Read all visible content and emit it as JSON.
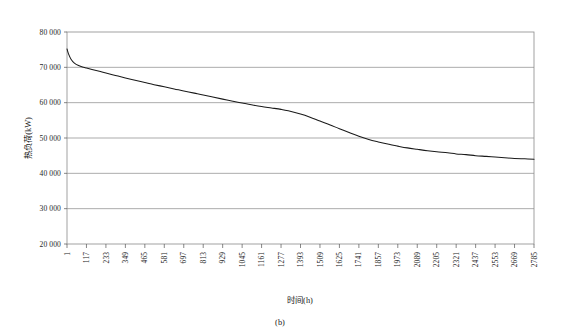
{
  "figure": {
    "caption": "(b)",
    "background": "#ffffff"
  },
  "chart_data": {
    "type": "line",
    "title": "",
    "xlabel": "时间(h)",
    "ylabel": "热负荷(kW)",
    "xlim": [
      1,
      2785
    ],
    "ylim": [
      20000,
      80000
    ],
    "grid": true,
    "legend": "none",
    "line_color": "#1a1a1a",
    "ytick_labels": [
      "80 000",
      "70 000",
      "60 000",
      "50 000",
      "40 000",
      "30 000",
      "20 000"
    ],
    "ytick_values": [
      80000,
      70000,
      60000,
      50000,
      40000,
      30000,
      20000
    ],
    "xtick_labels": [
      "1",
      "117",
      "233",
      "349",
      "465",
      "581",
      "697",
      "813",
      "929",
      "1045",
      "1161",
      "1277",
      "1393",
      "1509",
      "1625",
      "1741",
      "1857",
      "1973",
      "2089",
      "2205",
      "2321",
      "2437",
      "2553",
      "2669",
      "2785"
    ],
    "xtick_values": [
      1,
      117,
      233,
      349,
      465,
      581,
      697,
      813,
      929,
      1045,
      1161,
      1277,
      1393,
      1509,
      1625,
      1741,
      1857,
      1973,
      2089,
      2205,
      2321,
      2437,
      2553,
      2669,
      2785
    ],
    "series": [
      {
        "name": "热负荷",
        "x": [
          1,
          10,
          25,
          45,
          70,
          100,
          117,
          150,
          200,
          233,
          290,
          349,
          420,
          465,
          520,
          581,
          640,
          697,
          760,
          813,
          870,
          929,
          990,
          1045,
          1100,
          1161,
          1220,
          1277,
          1320,
          1393,
          1450,
          1509,
          1570,
          1625,
          1690,
          1741,
          1800,
          1857,
          1920,
          1973,
          2030,
          2089,
          2150,
          2205,
          2270,
          2321,
          2380,
          2437,
          2500,
          2553,
          2610,
          2669,
          2730,
          2785
        ],
        "y": [
          75200,
          73800,
          72300,
          71200,
          70500,
          70000,
          69800,
          69400,
          68800,
          68400,
          67700,
          67000,
          66200,
          65700,
          65100,
          64500,
          63900,
          63300,
          62700,
          62200,
          61600,
          61000,
          60400,
          59900,
          59400,
          58900,
          58500,
          58100,
          57700,
          56800,
          55900,
          54800,
          53700,
          52600,
          51400,
          50500,
          49600,
          48900,
          48200,
          47700,
          47200,
          46800,
          46400,
          46100,
          45800,
          45500,
          45300,
          45000,
          44800,
          44600,
          44400,
          44200,
          44100,
          44000
        ]
      }
    ]
  }
}
